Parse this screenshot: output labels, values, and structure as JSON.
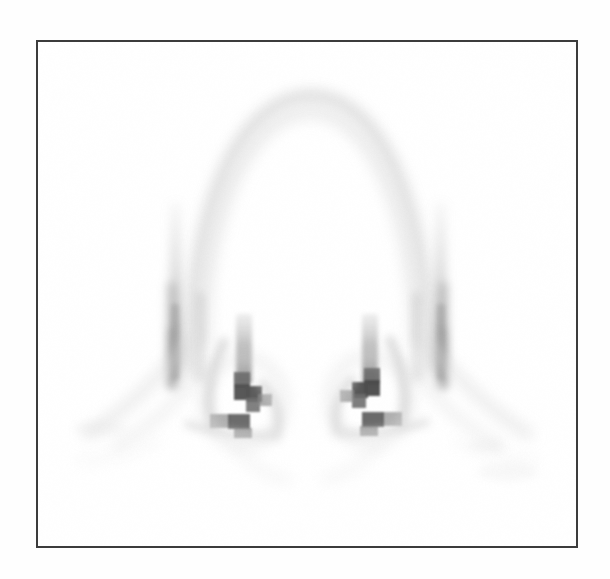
{
  "figure": {
    "kind": "medical-scan-image",
    "modality": "nuclear-medicine-scintigraphy",
    "view": "posterior",
    "title": "",
    "caption": "",
    "colormap": "grayscale-inverted",
    "background_color": "#ffffff",
    "frame_color": "#3c3c3c",
    "frame_width_px": 2,
    "frame_rect": {
      "x": 36,
      "y": 40,
      "width": 542,
      "height": 508
    },
    "image_width": 610,
    "image_height": 579,
    "has_text_labels": false,
    "has_axes": false,
    "has_legend": false,
    "has_colorbar": false,
    "pixelation_visible": true
  },
  "chart_data": {
    "type": "heatmap",
    "title": "",
    "subtitle": "",
    "xlabel": "",
    "ylabel": "",
    "legend": [],
    "grid": false,
    "colormap": "grayscale",
    "value_meaning": "radiotracer uptake (darker = higher counts)",
    "intensity_scale": {
      "min_label": "low",
      "max_label": "high",
      "min_gray": "#ffffff",
      "max_gray": "#3a3a3a"
    },
    "regions": [
      {
        "name": "upper-dome-contour",
        "description": "faint arched contour across the upper field",
        "intensity": 0.06,
        "gray": "#f0f0f0",
        "cx": 307,
        "cy": 235,
        "rx": 140,
        "ry": 160
      },
      {
        "name": "left-lateral-band",
        "description": "vertical edge band on the left, darkening inferiorly",
        "intensity": 0.22,
        "gray": "#cfcfcf",
        "x": 165,
        "y": 200,
        "width": 16,
        "height": 170
      },
      {
        "name": "right-lateral-band",
        "description": "vertical edge band on the right, darkening inferiorly",
        "intensity": 0.22,
        "gray": "#cfcfcf",
        "x": 430,
        "y": 200,
        "width": 16,
        "height": 170
      },
      {
        "name": "left-hilar-focus",
        "description": "blocky dark hilar hot spot, left of midline",
        "intensity": 0.72,
        "gray": "#4a4a4a",
        "cx": 243,
        "cy": 382,
        "rx": 16,
        "ry": 18
      },
      {
        "name": "right-hilar-focus",
        "description": "blocky dark hilar hot spot, right of midline",
        "intensity": 0.74,
        "gray": "#474747",
        "cx": 378,
        "cy": 378,
        "rx": 16,
        "ry": 18
      },
      {
        "name": "left-basal-bar",
        "description": "short horizontal dark bar inferior to left hilum",
        "intensity": 0.62,
        "gray": "#5c5c5c",
        "x": 218,
        "y": 402,
        "width": 42,
        "height": 14
      },
      {
        "name": "right-basal-bar",
        "description": "short horizontal dark bar inferior to right hilum",
        "intensity": 0.62,
        "gray": "#5c5c5c",
        "x": 363,
        "y": 400,
        "width": 42,
        "height": 14
      },
      {
        "name": "left-costophrenic-sweep",
        "description": "faint diagonal contour sweeping inferolaterally on the left",
        "intensity": 0.12,
        "gray": "#e2e2e2"
      },
      {
        "name": "right-costophrenic-sweep",
        "description": "faint diagonal contour sweeping inferolaterally on the right",
        "intensity": 0.12,
        "gray": "#e2e2e2"
      }
    ]
  }
}
